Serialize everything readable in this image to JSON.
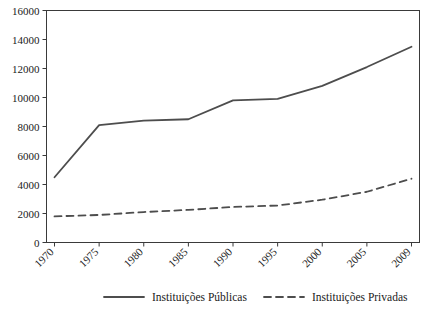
{
  "chart_data": {
    "type": "line",
    "title": "",
    "xlabel": "",
    "ylabel": "",
    "x": [
      "1970",
      "1975",
      "1980",
      "1985",
      "1990",
      "1995",
      "2000",
      "2005",
      "2009"
    ],
    "categories": [
      "1970",
      "1975",
      "1980",
      "1985",
      "1990",
      "1995",
      "2000",
      "2005",
      "2009"
    ],
    "ylim": [
      0,
      16000
    ],
    "yticks": [
      "0",
      "2000",
      "4000",
      "6000",
      "8000",
      "10000",
      "12000",
      "14000",
      "16000"
    ],
    "grid": false,
    "legend_position": "bottom",
    "series": [
      {
        "name": "Instituições Públicas",
        "style": "solid",
        "color": "#4d4d4d",
        "values": [
          4500,
          8100,
          8400,
          8500,
          9800,
          9900,
          10800,
          12100,
          13500
        ]
      },
      {
        "name": "Instituições Privadas",
        "style": "dashed",
        "color": "#4d4d4d",
        "values": [
          1800,
          1900,
          2100,
          2250,
          2450,
          2550,
          2950,
          3500,
          4400
        ]
      }
    ]
  },
  "legend": {
    "items": [
      {
        "label": "Instituições Públicas",
        "style": "solid"
      },
      {
        "label": "Instituições Privadas",
        "style": "dashed"
      }
    ]
  }
}
